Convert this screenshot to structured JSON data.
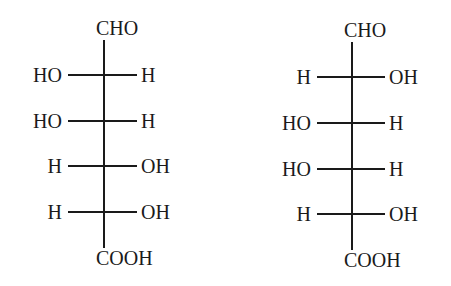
{
  "diagram": {
    "type": "Fischer projections",
    "structures": [
      {
        "top": "CHO",
        "bottom": "COOH",
        "rows": [
          {
            "left": "HO",
            "right": "H"
          },
          {
            "left": "HO",
            "right": "H"
          },
          {
            "left": "H",
            "right": "OH"
          },
          {
            "left": "H",
            "right": "OH"
          }
        ]
      },
      {
        "top": "CHO",
        "bottom": "COOH",
        "rows": [
          {
            "left": "H",
            "right": "OH"
          },
          {
            "left": "HO",
            "right": "H"
          },
          {
            "left": "HO",
            "right": "H"
          },
          {
            "left": "H",
            "right": "OH"
          }
        ]
      }
    ]
  }
}
